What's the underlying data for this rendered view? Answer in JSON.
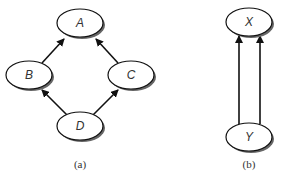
{
  "panels": [
    {
      "caption": "(a)",
      "nodes": [
        {
          "id": "A",
          "label": "A",
          "cx": 80,
          "cy": 23
        },
        {
          "id": "B",
          "label": "B",
          "cx": 29,
          "cy": 75
        },
        {
          "id": "C",
          "label": "C",
          "cx": 131,
          "cy": 75
        },
        {
          "id": "D",
          "label": "D",
          "cx": 80,
          "cy": 126
        }
      ],
      "edges": [
        {
          "from": "B",
          "to": "A"
        },
        {
          "from": "C",
          "to": "A"
        },
        {
          "from": "D",
          "to": "B"
        },
        {
          "from": "D",
          "to": "C"
        }
      ]
    },
    {
      "caption": "(b)",
      "nodes": [
        {
          "id": "X",
          "label": "X",
          "cx": 249,
          "cy": 22
        },
        {
          "id": "Y",
          "label": "Y",
          "cx": 249,
          "cy": 137
        }
      ],
      "edges": [
        {
          "from": "Y",
          "to": "X"
        },
        {
          "from": "Y",
          "to": "X"
        }
      ]
    }
  ],
  "colors": {
    "stroke": "#111111",
    "shadow": "#555555",
    "fill": "#ffffff"
  }
}
